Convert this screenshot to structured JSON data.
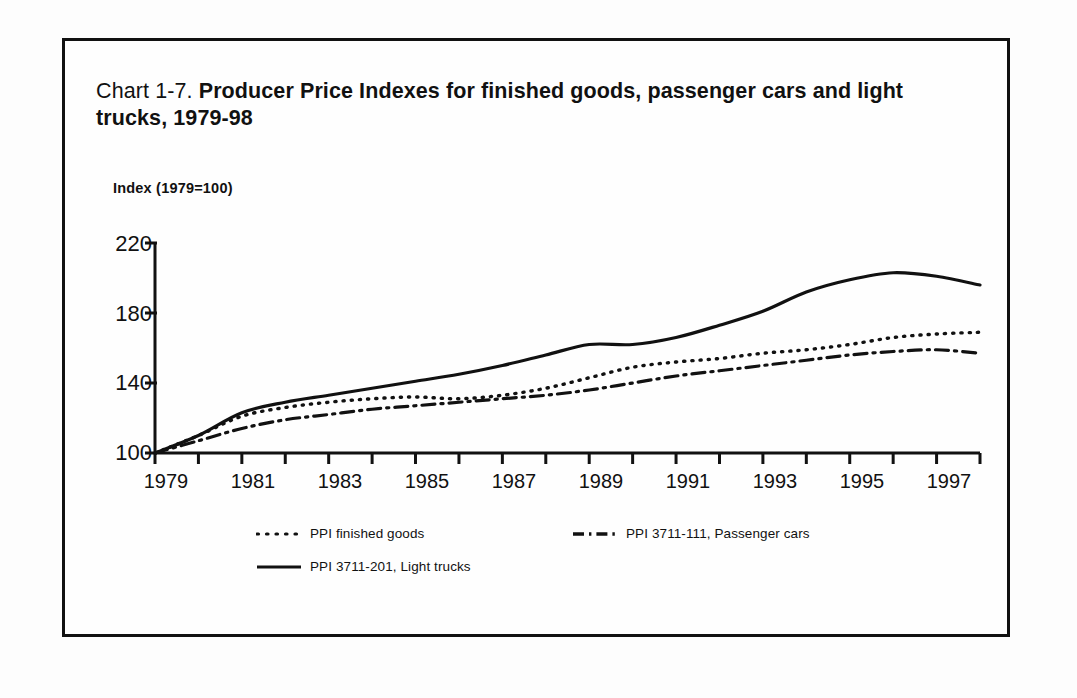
{
  "figure": {
    "label": "Chart 1-7.",
    "title": "Producer Price Indexes for finished goods, passenger cars and light trucks, 1979-98",
    "axis_note": "Index (1979=100)",
    "frame_color": "#111111"
  },
  "legend": {
    "items": [
      {
        "name": "ppi-finished-goods",
        "label": "PPI finished goods",
        "style": "dotted"
      },
      {
        "name": "ppi-passenger-cars",
        "label": "PPI 3711-111, Passenger cars",
        "style": "dash-dot"
      },
      {
        "name": "ppi-light-trucks",
        "label": "PPI 3711-201, Light trucks",
        "style": "solid"
      }
    ]
  },
  "chart_data": {
    "type": "line",
    "title": "Chart 1-7. Producer Price Indexes for finished goods, passenger cars and light trucks, 1979-98",
    "xlabel": "",
    "ylabel": "Index (1979=100)",
    "grid": false,
    "legend_position": "bottom",
    "xlim": [
      1979,
      1998
    ],
    "ylim": [
      100,
      220
    ],
    "yticks": [
      100,
      140,
      180,
      220
    ],
    "xticks": [
      1979,
      1981,
      1983,
      1985,
      1987,
      1989,
      1991,
      1993,
      1995,
      1997
    ],
    "xtick_minor_every": 1,
    "x": [
      1979,
      1980,
      1981,
      1982,
      1983,
      1984,
      1985,
      1986,
      1987,
      1988,
      1989,
      1990,
      1991,
      1992,
      1993,
      1994,
      1995,
      1996,
      1997,
      1998
    ],
    "series": [
      {
        "name": "PPI finished goods",
        "style": "dotted",
        "values": [
          100,
          110,
          121,
          126,
          129,
          131,
          132,
          131,
          133,
          137,
          143,
          149,
          152,
          154,
          157,
          159,
          162,
          166,
          168,
          169
        ]
      },
      {
        "name": "PPI 3711-111, Passenger cars",
        "style": "dash-dot",
        "values": [
          100,
          107,
          114,
          119,
          122,
          125,
          127,
          129,
          131,
          133,
          136,
          140,
          144,
          147,
          150,
          153,
          156,
          158,
          159,
          157
        ]
      },
      {
        "name": "PPI 3711-201, Light trucks",
        "style": "solid",
        "values": [
          100,
          110,
          123,
          129,
          133,
          137,
          141,
          145,
          150,
          156,
          162,
          162,
          166,
          173,
          181,
          192,
          199,
          203,
          201,
          196
        ]
      }
    ]
  },
  "axis_ticks": {
    "y_labels": [
      "220",
      "180",
      "140",
      "100"
    ],
    "x_labels": [
      "1979",
      "1981",
      "1983",
      "1985",
      "1987",
      "1989",
      "1991",
      "1993",
      "1995",
      "1997"
    ]
  }
}
